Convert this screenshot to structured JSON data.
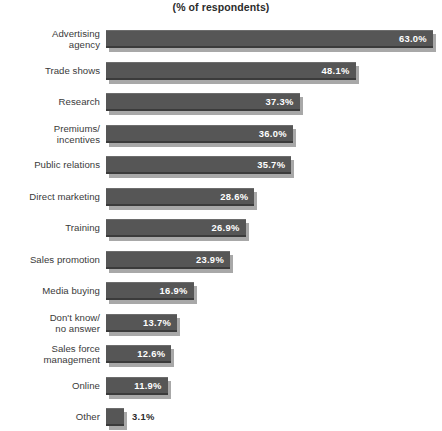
{
  "chart_data": {
    "type": "bar",
    "title": "(% of respondents)",
    "subtitle": "",
    "xlabel": "",
    "ylabel": "",
    "orientation": "horizontal",
    "grid": false,
    "legend": null,
    "xlim": [
      0,
      63
    ],
    "value_suffix": "%",
    "categories": [
      "Advertising agency",
      "Trade shows",
      "Research",
      "Premiums/ incentives",
      "Public relations",
      "Direct marketing",
      "Training",
      "Sales promotion",
      "Media buying",
      "Don't know/ no answer",
      "Sales force management",
      "Online",
      "Other"
    ],
    "values": [
      63.0,
      48.1,
      37.3,
      36.0,
      35.7,
      28.6,
      26.9,
      23.9,
      16.9,
      13.7,
      12.6,
      11.9,
      3.1
    ],
    "bars": [
      {
        "label_line1": "Advertising",
        "label_line2": "agency",
        "value": 63.0,
        "value_label": "63.0%",
        "label_position": "inside"
      },
      {
        "label_line1": "Trade shows",
        "label_line2": "",
        "value": 48.1,
        "value_label": "48.1%",
        "label_position": "inside"
      },
      {
        "label_line1": "Research",
        "label_line2": "",
        "value": 37.3,
        "value_label": "37.3%",
        "label_position": "inside"
      },
      {
        "label_line1": "Premiums/",
        "label_line2": "incentives",
        "value": 36.0,
        "value_label": "36.0%",
        "label_position": "inside"
      },
      {
        "label_line1": "Public relations",
        "label_line2": "",
        "value": 35.7,
        "value_label": "35.7%",
        "label_position": "inside"
      },
      {
        "label_line1": "Direct marketing",
        "label_line2": "",
        "value": 28.6,
        "value_label": "28.6%",
        "label_position": "inside"
      },
      {
        "label_line1": "Training",
        "label_line2": "",
        "value": 26.9,
        "value_label": "26.9%",
        "label_position": "inside"
      },
      {
        "label_line1": "Sales promotion",
        "label_line2": "",
        "value": 23.9,
        "value_label": "23.9%",
        "label_position": "inside"
      },
      {
        "label_line1": "Media buying",
        "label_line2": "",
        "value": 16.9,
        "value_label": "16.9%",
        "label_position": "inside"
      },
      {
        "label_line1": "Don't know/",
        "label_line2": "no answer",
        "value": 13.7,
        "value_label": "13.7%",
        "label_position": "inside"
      },
      {
        "label_line1": "Sales force",
        "label_line2": "management",
        "value": 12.6,
        "value_label": "12.6%",
        "label_position": "inside"
      },
      {
        "label_line1": "Online",
        "label_line2": "",
        "value": 11.9,
        "value_label": "11.9%",
        "label_position": "inside"
      },
      {
        "label_line1": "Other",
        "label_line2": "",
        "value": 3.1,
        "value_label": "3.1%",
        "label_position": "outside"
      }
    ]
  },
  "style": {
    "bar_color": "#565656",
    "bar_shadow_color": "#a8a8a8",
    "bar_top_highlight": "#6d6d6d",
    "bar_bottom_edge": "#3b3b3b",
    "inside_label_color": "#ffffff",
    "outside_label_color": "#2b2b2b",
    "category_label_color": "#3a3a3a",
    "background": "#ffffff"
  },
  "layout": {
    "bar_left_px": 106,
    "row_pitch_px": 31.5,
    "first_row_top_px": 29,
    "bar_height_px": 18,
    "px_per_unit": 5.19,
    "min_bar_px": 18
  }
}
